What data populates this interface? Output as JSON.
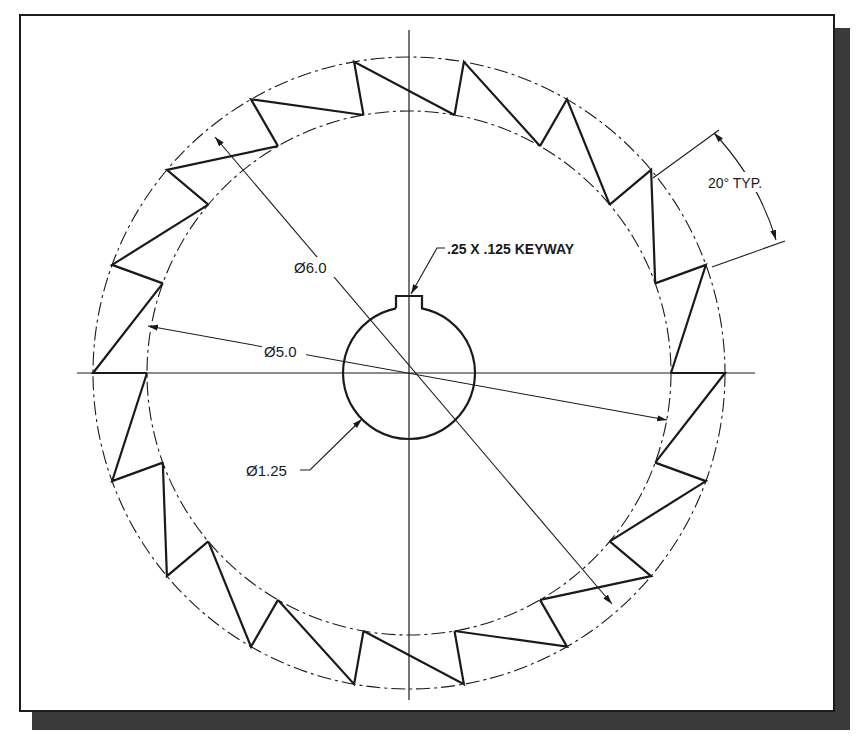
{
  "drawing": {
    "title": "Ratchet wheel",
    "labels": {
      "outer_diameter": "Ø6.0",
      "root_diameter": "Ø5.0",
      "bore_diameter": "Ø1.25",
      "keyway": ".25 X .125 KEYWAY",
      "tooth_angle": "20° TYP."
    },
    "geometry": {
      "center": [
        409,
        373
      ],
      "outer_radius_px": 316,
      "root_radius_px": 262,
      "bore_radius_px": 66,
      "tooth_count": 18,
      "tooth_pitch_deg": 20
    },
    "colors": {
      "line": "#1a1a1a",
      "shadow": "#3a3a3a",
      "paper": "#ffffff"
    }
  }
}
